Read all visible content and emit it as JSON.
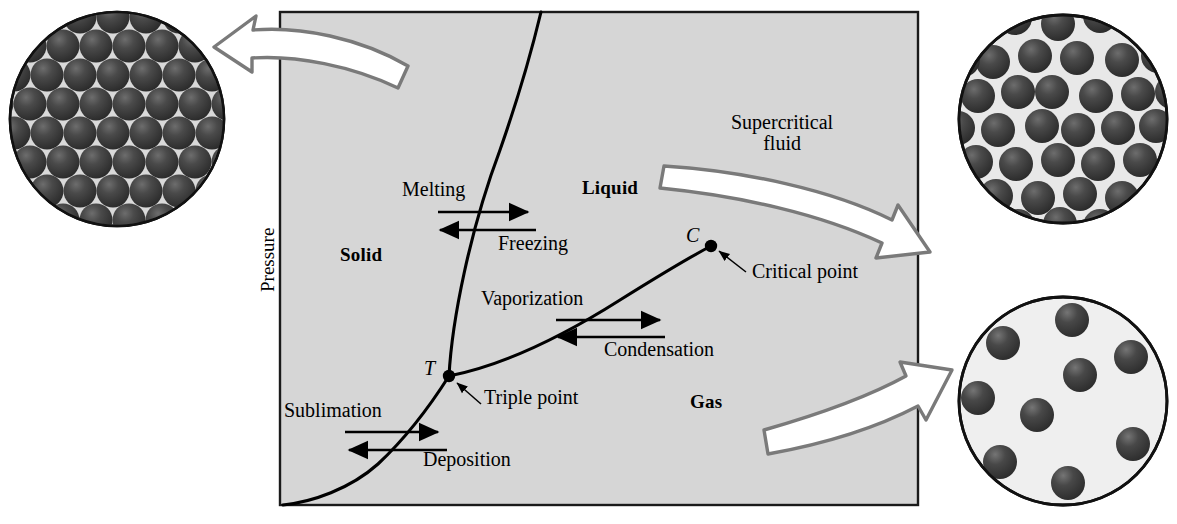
{
  "figure": {
    "type": "phase-diagram",
    "axis": {
      "y_label": "Pressure",
      "x_label": ""
    },
    "plot_area": {
      "background_color": "#d6d6d6",
      "border_color": "#1a1a1a",
      "x": 280,
      "y": 12,
      "width": 638,
      "height": 493
    },
    "regions": [
      {
        "name": "solid",
        "label": "Solid",
        "x": 340,
        "y": 254
      },
      {
        "name": "liquid",
        "label": "Liquid",
        "x": 582,
        "y": 187
      },
      {
        "name": "gas",
        "label": "Gas",
        "x": 690,
        "y": 400
      },
      {
        "name": "supercritical-fluid",
        "label": "Supercritical\nfluid",
        "x": 731,
        "y": 113
      }
    ],
    "processes": [
      {
        "name": "melting",
        "label": "Melting",
        "direction": "right",
        "x": 402,
        "y": 181
      },
      {
        "name": "freezing",
        "label": "Freezing",
        "direction": "left",
        "x": 498,
        "y": 235
      },
      {
        "name": "vaporization",
        "label": "Vaporization",
        "direction": "right",
        "x": 481,
        "y": 289
      },
      {
        "name": "condensation",
        "label": "Condensation",
        "direction": "left",
        "x": 604,
        "y": 339
      },
      {
        "name": "sublimation",
        "label": "Sublimation",
        "direction": "right",
        "x": 284,
        "y": 404
      },
      {
        "name": "deposition",
        "label": "Deposition",
        "direction": "left",
        "x": 423,
        "y": 450
      }
    ],
    "points": [
      {
        "name": "critical-point",
        "symbol": "C",
        "label": "Critical point",
        "symbol_x": 686,
        "symbol_y": 228,
        "label_x": 752,
        "label_y": 270,
        "dot_x": 711,
        "dot_y": 246
      },
      {
        "name": "triple-point",
        "symbol": "T",
        "label": "Triple point",
        "symbol_x": 424,
        "symbol_y": 362,
        "label_x": 484,
        "label_y": 393,
        "dot_x": 449,
        "dot_y": 376
      }
    ],
    "curves": {
      "fusion_name": "melting-curve",
      "vaporization_name": "vaporization-curve",
      "sublimation_name": "sublimation-curve"
    },
    "insets": [
      {
        "name": "solid-molecular-inset",
        "phase": "solid",
        "arrangement": "close-packed ordered lattice",
        "circle": {
          "cx": 117,
          "cy": 119,
          "r": 107
        },
        "sphere_color": "#3a3a3a",
        "background_color": "#d9d9d9",
        "particle_count": 57
      },
      {
        "name": "liquid-molecular-inset",
        "phase": "liquid",
        "arrangement": "close-packed disordered",
        "circle": {
          "cx": 1063,
          "cy": 119,
          "r": 104
        },
        "sphere_color": "#3a3a3a",
        "background_color": "#e8e8e8",
        "particle_count": 40
      },
      {
        "name": "gas-molecular-inset",
        "phase": "gas",
        "arrangement": "sparse random",
        "circle": {
          "cx": 1063,
          "cy": 401,
          "r": 104
        },
        "sphere_color": "#3a3a3a",
        "background_color": "#efefef",
        "particle_count": 9
      }
    ],
    "callout_arrows": [
      {
        "name": "callout-arrow-solid",
        "points_to": "solid-molecular-inset",
        "direction": "left"
      },
      {
        "name": "callout-arrow-liquid",
        "points_to": "liquid-molecular-inset",
        "direction": "right"
      },
      {
        "name": "callout-arrow-gas",
        "points_to": "gas-molecular-inset",
        "direction": "right"
      }
    ],
    "colors": {
      "plot_fill": "#d6d6d6",
      "curve": "#000000",
      "callout_stroke": "#7a7a7a",
      "callout_fill": "#ffffff",
      "sphere": "#3a3a3a"
    }
  }
}
